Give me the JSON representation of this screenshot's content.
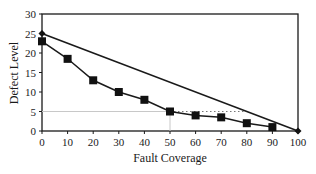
{
  "chart_data": {
    "type": "line",
    "title": "",
    "xlabel": "Fault Coverage",
    "ylabel": "Defect Level",
    "xlim": [
      0,
      100
    ],
    "ylim": [
      0,
      30
    ],
    "x_ticks": [
      "0",
      "10",
      "20",
      "30",
      "40",
      "50",
      "60",
      "70",
      "80",
      "90",
      "100"
    ],
    "y_ticks": [
      "0",
      "5",
      "10",
      "15",
      "20",
      "25",
      "30"
    ],
    "grid": false,
    "legend": null,
    "series": [
      {
        "name": "linear",
        "marker": "diamond",
        "x": [
          0,
          100
        ],
        "values": [
          25,
          0
        ]
      },
      {
        "name": "measured",
        "marker": "square",
        "x": [
          0,
          10,
          20,
          30,
          40,
          50,
          60,
          70,
          80,
          90
        ],
        "values": [
          23,
          18.5,
          13,
          10,
          8,
          5,
          4,
          3.5,
          2,
          1
        ]
      }
    ],
    "annotations": [
      {
        "type": "reference-line",
        "style": "faint-solid",
        "orientation": "horizontal",
        "y": 5,
        "x_from": 0,
        "x_to": 50
      },
      {
        "type": "reference-line",
        "style": "faint-solid",
        "orientation": "vertical",
        "x": 50,
        "y_from": 0,
        "y_to": 5
      },
      {
        "type": "reference-line",
        "style": "dotted",
        "orientation": "horizontal",
        "y": 5,
        "x_from": 50,
        "x_to": 80
      }
    ],
    "colors": {
      "line": "#1a1a1a",
      "marker": "#111111",
      "reference": "#c8c8c8"
    }
  }
}
